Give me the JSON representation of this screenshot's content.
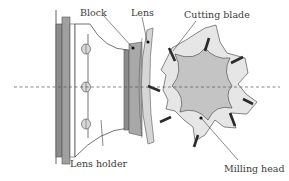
{
  "diagram": {
    "type": "schematic",
    "labels": {
      "block": "Block",
      "lens": "Lens",
      "cutting_blade": "Cutting blade",
      "lens_holder": "Lens holder",
      "milling_head": "Milling head"
    },
    "components": [
      {
        "id": "lens-holder",
        "label": "Lens holder"
      },
      {
        "id": "block",
        "label": "Block"
      },
      {
        "id": "lens",
        "label": "Lens"
      },
      {
        "id": "milling-head",
        "label": "Milling head"
      },
      {
        "id": "cutting-blade",
        "label": "Cutting blade",
        "count": 8
      }
    ],
    "axis": {
      "style": "dashed",
      "orientation": "horizontal"
    },
    "colors": {
      "dark_gray": "#8c8c8c",
      "mid_gray": "#a8a8a8",
      "light_gray": "#c8c8c8",
      "milling_inner": "#c4c4c4",
      "milling_outer": "#e6e6e6",
      "blade": "#2a2a2a",
      "line": "#3a3a3a"
    }
  }
}
